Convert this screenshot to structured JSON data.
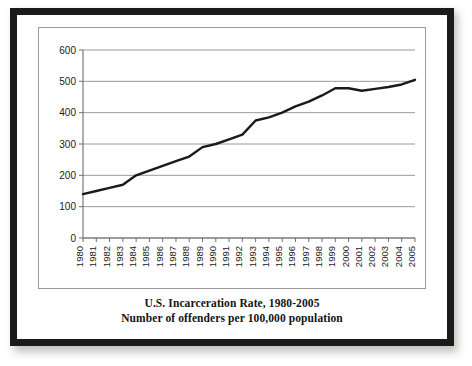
{
  "caption": {
    "line1": "U.S. Incarceration Rate, 1980-2005",
    "line2": "Number of offenders per 100,000 population"
  },
  "colors": {
    "frame": "#1b1b1b",
    "line": "#1a1a1a",
    "gridline": "#8f8f8f",
    "axis": "#6d6d6d",
    "background": "#ffffff"
  },
  "chart_data": {
    "type": "line",
    "title": "U.S. Incarceration Rate, 1980-2005",
    "subtitle": "Number of offenders per 100,000 population",
    "xlabel": "",
    "ylabel": "",
    "ylim": [
      0,
      600
    ],
    "yticks": [
      0,
      100,
      200,
      300,
      400,
      500,
      600
    ],
    "ytick_labels": [
      "0",
      "100",
      "200",
      "300",
      "400",
      "500",
      "600"
    ],
    "grid": true,
    "legend": false,
    "x": [
      1980,
      1981,
      1982,
      1983,
      1984,
      1985,
      1986,
      1987,
      1988,
      1989,
      1990,
      1991,
      1992,
      1993,
      1994,
      1995,
      1996,
      1997,
      1998,
      1999,
      2000,
      2001,
      2002,
      2003,
      2004,
      2005
    ],
    "categories": [
      "1980",
      "1981",
      "1982",
      "1983",
      "1984",
      "1985",
      "1986",
      "1987",
      "1988",
      "1989",
      "1990",
      "1991",
      "1992",
      "1993",
      "1994",
      "1995",
      "1996",
      "1997",
      "1998",
      "1999",
      "2000",
      "2001",
      "2002",
      "2003",
      "2004",
      "2005"
    ],
    "values": [
      140,
      150,
      160,
      170,
      200,
      215,
      230,
      245,
      260,
      290,
      300,
      315,
      330,
      375,
      385,
      400,
      420,
      435,
      455,
      478,
      478,
      470,
      476,
      482,
      490,
      505
    ],
    "series": [
      {
        "name": "Incarceration rate per 100,000 population",
        "values": [
          140,
          150,
          160,
          170,
          200,
          215,
          230,
          245,
          260,
          290,
          300,
          315,
          330,
          375,
          385,
          400,
          420,
          435,
          455,
          478,
          478,
          470,
          476,
          482,
          490,
          505
        ]
      }
    ]
  }
}
